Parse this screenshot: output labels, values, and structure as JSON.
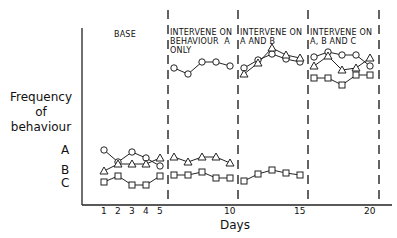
{
  "chart_data": {
    "type": "line",
    "title": "",
    "xlabel": "Days",
    "ylabel": "Frequency of behaviour",
    "ylabel_lines": [
      "Frequency",
      "of",
      "behaviour"
    ],
    "x": [
      1,
      2,
      3,
      4,
      5,
      6,
      7,
      8,
      9,
      10,
      11,
      12,
      13,
      14,
      15,
      16,
      17,
      18,
      19,
      20
    ],
    "x_ticks": [
      "1",
      "2",
      "3",
      "4",
      "5",
      "10",
      "15",
      "20"
    ],
    "grid": false,
    "legend": "inline labels A, B, C at left of series",
    "phases": [
      {
        "label": "BASE",
        "days": [
          1,
          5
        ]
      },
      {
        "label": "INTERVENE ON\nBEHAVIOUR  A\nONLY",
        "days": [
          6,
          10
        ]
      },
      {
        "label": "INTERVENE ON\nA AND B",
        "days": [
          11,
          15
        ]
      },
      {
        "label": "INTERVENE ON\nA, B AND C",
        "days": [
          16,
          20
        ]
      }
    ],
    "series": [
      {
        "name": "A",
        "marker": "circle",
        "values": [
          150,
          162,
          152,
          158,
          166,
          68,
          74,
          62,
          62,
          66,
          68,
          60,
          54,
          59,
          62,
          57,
          52,
          55,
          55,
          66
        ]
      },
      {
        "name": "B",
        "marker": "triangle",
        "values": [
          171,
          164,
          164,
          164,
          158,
          157,
          162,
          157,
          157,
          163,
          74,
          63,
          48,
          55,
          58,
          66,
          56,
          70,
          68,
          58
        ]
      },
      {
        "name": "C",
        "marker": "square",
        "values": [
          182,
          176,
          185,
          185,
          176,
          175,
          175,
          172,
          178,
          178,
          181,
          174,
          170,
          173,
          175,
          78,
          78,
          85,
          75,
          75
        ]
      }
    ],
    "value_note": "values are pixel y-positions (no numeric y scale shown; smaller = higher frequency)"
  },
  "labels": {
    "ylabel_1": "Frequency",
    "ylabel_2": "of",
    "ylabel_3": "behaviour",
    "xlabel": "Days",
    "phase_1": "BASE",
    "phase_2": "INTERVENE ON\nBEHAVIOUR  A\nONLY",
    "phase_3": "INTERVENE ON\nA AND B",
    "phase_4": "INTERVENE ON\nA, B AND C",
    "series_a": "A",
    "series_b": "B",
    "series_c": "C",
    "ticks": [
      "1",
      "2",
      "3",
      "4",
      "5",
      "10",
      "15",
      "20"
    ]
  }
}
